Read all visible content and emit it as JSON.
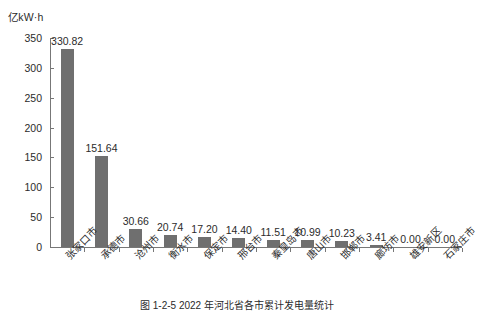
{
  "chart_data": {
    "type": "bar",
    "title": "",
    "caption": "图 1-2-5  2022 年河北省各市累计发电量统计",
    "xlabel": "",
    "ylabel": "亿kW·h",
    "ylim": [
      0,
      350
    ],
    "yticks": [
      "0",
      "50",
      "100",
      "150",
      "200",
      "250",
      "300",
      "350"
    ],
    "ytick_values": [
      0,
      50,
      100,
      150,
      200,
      250,
      300,
      350
    ],
    "grid": false,
    "legend": "none",
    "categories": [
      "张家口市",
      "承德市",
      "沧州市",
      "衡水市",
      "保定市",
      "邢台市",
      "秦皇岛市",
      "唐山市",
      "邯郸市",
      "廊坊市",
      "雄安新区",
      "石家庄市"
    ],
    "values": [
      330.82,
      151.64,
      30.66,
      20.74,
      17.2,
      14.4,
      11.51,
      10.99,
      10.23,
      3.41,
      0.0,
      0.0
    ],
    "value_labels": [
      "330.82",
      "151.64",
      "30.66",
      "20.74",
      "17.20",
      "14.40",
      "11.51",
      "10.99",
      "10.23",
      "3.41",
      "0.00",
      "0.00"
    ],
    "bar_color": "#6f6f6f",
    "axis_color": "#777777"
  }
}
